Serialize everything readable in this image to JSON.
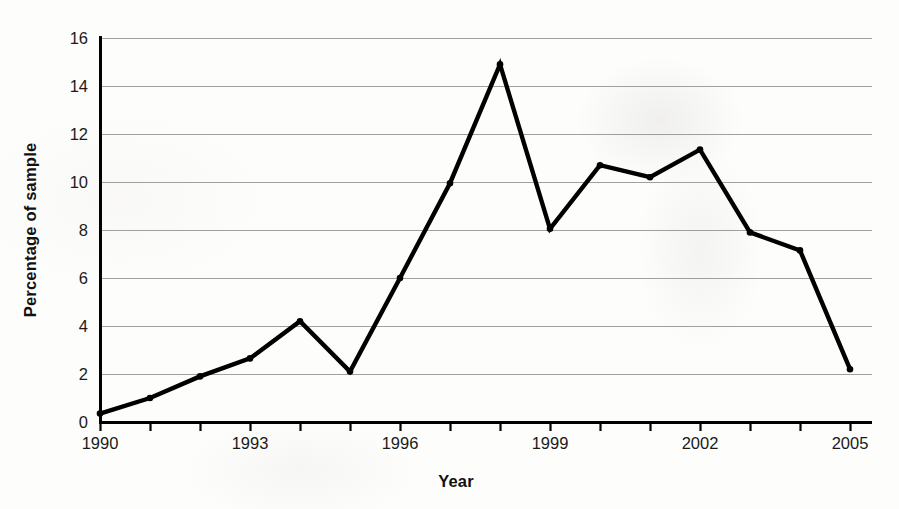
{
  "chart_data": {
    "type": "line",
    "title": "",
    "xlabel": "Year",
    "ylabel": "Percentage of sample",
    "x": [
      1990,
      1991,
      1992,
      1993,
      1994,
      1995,
      1996,
      1997,
      1998,
      1999,
      2000,
      2001,
      2002,
      2003,
      2004,
      2005
    ],
    "values": [
      0.35,
      1.0,
      1.9,
      2.65,
      4.2,
      2.1,
      6.0,
      9.95,
      14.9,
      8.05,
      10.7,
      10.2,
      11.35,
      7.9,
      7.15,
      2.2
    ],
    "series": [
      {
        "name": "Percentage of sample",
        "values": [
          0.35,
          1.0,
          1.9,
          2.65,
          4.2,
          2.1,
          6.0,
          9.95,
          14.9,
          8.05,
          10.7,
          10.2,
          11.35,
          7.9,
          7.15,
          2.2
        ]
      }
    ],
    "xlim": [
      1990,
      2005
    ],
    "ylim": [
      0,
      16
    ],
    "y_ticks": [
      0,
      2,
      4,
      6,
      8,
      10,
      12,
      14,
      16
    ],
    "y_tick_labels": [
      "0",
      "2",
      "4",
      "6",
      "8",
      "10",
      "12",
      "14",
      "16"
    ],
    "x_ticks": [
      1990,
      1991,
      1992,
      1993,
      1994,
      1995,
      1996,
      1997,
      1998,
      1999,
      2000,
      2001,
      2002,
      2003,
      2004,
      2005
    ],
    "x_tick_labels_shown": [
      "1990",
      "1993",
      "1996",
      "1999",
      "2002",
      "2005"
    ],
    "x_tick_label_years": [
      1990,
      1993,
      1996,
      1999,
      2002,
      2005
    ],
    "grid": true,
    "grid_axis": "y",
    "legend": false,
    "legend_position": "none",
    "markers": true,
    "line_color": "#000000",
    "grid_color": "#8a8a8a",
    "axis_color": "#000000",
    "background_color": "#fdfdfc"
  },
  "axis_titles": {
    "y": "Percentage of sample",
    "x": "Year"
  }
}
